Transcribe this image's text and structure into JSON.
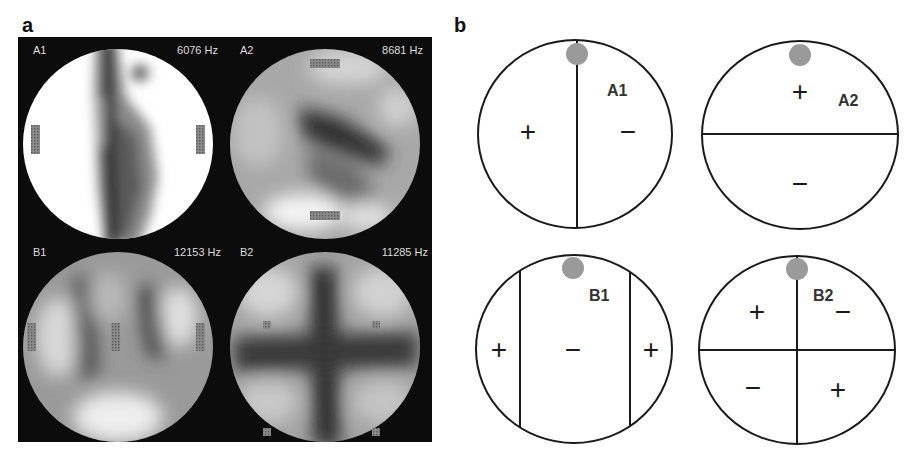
{
  "figure": {
    "panel_a": {
      "label": "a",
      "maps": [
        {
          "id": "A1",
          "frequency": "6076 Hz"
        },
        {
          "id": "A2",
          "frequency": "8681 Hz"
        },
        {
          "id": "B1",
          "frequency": "12153 Hz"
        },
        {
          "id": "B2",
          "frequency": "11285 Hz"
        }
      ]
    },
    "panel_b": {
      "label": "b",
      "diagrams": [
        {
          "id": "A1",
          "signs": [
            "+",
            "−"
          ],
          "division": "vertical"
        },
        {
          "id": "A2",
          "signs": [
            "+",
            "−"
          ],
          "division": "horizontal"
        },
        {
          "id": "B1",
          "signs": [
            "+",
            "−",
            "+"
          ],
          "division": "two-vertical"
        },
        {
          "id": "B2",
          "signs": [
            "+",
            "−",
            "−",
            "+"
          ],
          "division": "cross"
        }
      ]
    },
    "colors": {
      "map_background": "#0c0c0c",
      "diagram_line": "#1a1a1a",
      "marker": "#9a9a9a"
    }
  }
}
